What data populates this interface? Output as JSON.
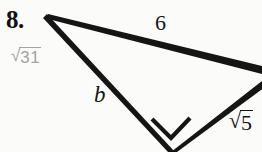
{
  "page": {
    "background_color": "#fbfbfa",
    "width": 262,
    "height": 152
  },
  "problem": {
    "number_label": "8.",
    "answer_annotation": {
      "radical_sign": "√",
      "radicand": "31",
      "full_text": "√31",
      "color": "#a3a3a3"
    }
  },
  "figure": {
    "type": "right-triangle",
    "stroke_color": "#151515",
    "labels": {
      "top_side": {
        "text": "6",
        "kind": "plain"
      },
      "left_side": {
        "text": "b",
        "kind": "variable-italic"
      },
      "right_side": {
        "radical_sign": "√",
        "radicand": "5",
        "full_text": "√5",
        "kind": "radical",
        "clipped_at_page_edge": true
      }
    },
    "right_angle_marker": {
      "present": true,
      "at_vertex": "bottom"
    },
    "vertices": {
      "top_left": [
        48,
        16
      ],
      "right": [
        272,
        72
      ],
      "bottom": [
        171,
        152
      ]
    }
  }
}
